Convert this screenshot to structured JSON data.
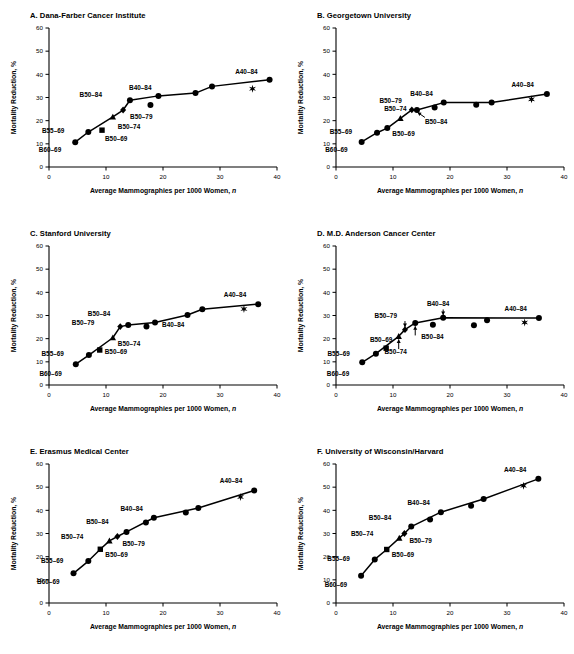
{
  "figure": {
    "axis_x_label": "Average Mammographies per 1000 Women,",
    "axis_x_label_italic": "n",
    "axis_y_label": "Mortality Reduction, %",
    "x_ticks": [
      "0",
      "10",
      "20",
      "30",
      "40"
    ],
    "y_ticks": [
      "0",
      "10",
      "20",
      "30",
      "40",
      "50",
      "60"
    ],
    "xlim": [
      0,
      40
    ],
    "ylim": [
      0,
      60
    ],
    "ink": "#000000",
    "background": "#ffffff"
  },
  "chart_data": [
    {
      "type": "scatter",
      "panel": "A",
      "title": "A. Dana-Farber Cancer Institute",
      "xlabel": "Average Mammographies per 1000 Women, n",
      "ylabel": "Mortality Reduction, %",
      "xlim": [
        0,
        40
      ],
      "ylim": [
        0,
        60
      ],
      "grid": false,
      "legend": "none",
      "points": [
        {
          "label": "B60-69",
          "x": 4.6,
          "y": 10.7,
          "marker": "circle",
          "label_dx": -14,
          "label_dy": 10
        },
        {
          "label": "B55-69",
          "x": 6.9,
          "y": 15.1,
          "marker": "circle",
          "label_dx": -24,
          "label_dy": 1
        },
        {
          "label": "B50-69",
          "x": 9.3,
          "y": 15.9,
          "marker": "square",
          "label_dx": 3,
          "label_dy": 11
        },
        {
          "label": "B50-74",
          "x": 11.2,
          "y": 21.6,
          "marker": "triangle",
          "label_dx": 5,
          "label_dy": 12
        },
        {
          "label": "B50-79",
          "x": 13.0,
          "y": 24.6,
          "marker": "diamond",
          "label_dx": 7,
          "label_dy": 9
        },
        {
          "label": "B50-84",
          "x": 14.2,
          "y": 28.8,
          "marker": "circle",
          "label_dx": -28,
          "label_dy": -3
        },
        {
          "label": "",
          "x": 17.8,
          "y": 26.8,
          "marker": "circle",
          "label_dx": 0,
          "label_dy": 0
        },
        {
          "label": "B40-84",
          "x": 19.2,
          "y": 30.7,
          "marker": "circle",
          "label_dx": -7,
          "label_dy": -6
        },
        {
          "label": "",
          "x": 25.7,
          "y": 31.9,
          "marker": "circle",
          "label_dx": 0,
          "label_dy": 0
        },
        {
          "label": "",
          "x": 28.6,
          "y": 34.8,
          "marker": "circle",
          "label_dx": 0,
          "label_dy": 0
        },
        {
          "label": "",
          "x": 35.7,
          "y": 33.8,
          "marker": "star",
          "label_dx": 0,
          "label_dy": 0
        },
        {
          "label": "A40-84",
          "x": 38.7,
          "y": 37.7,
          "marker": "circle",
          "label_dx": -12,
          "label_dy": -6
        }
      ],
      "curve": [
        [
          4.6,
          10.7
        ],
        [
          6.9,
          15.1
        ],
        [
          11.2,
          21.6
        ],
        [
          13.0,
          24.6
        ],
        [
          14.2,
          28.8
        ],
        [
          19.2,
          30.7
        ],
        [
          25.7,
          31.9
        ],
        [
          28.6,
          34.8
        ],
        [
          38.7,
          37.7
        ]
      ],
      "arrows": []
    },
    {
      "type": "scatter",
      "panel": "B",
      "title": "B. Georgetown University",
      "xlabel": "Average Mammographies per 1000 Women, n",
      "ylabel": "Mortality Reduction, %",
      "xlim": [
        0,
        40
      ],
      "ylim": [
        0,
        60
      ],
      "grid": false,
      "legend": "none",
      "points": [
        {
          "label": "B60-69",
          "x": 4.5,
          "y": 10.8,
          "marker": "circle",
          "label_dx": -14,
          "label_dy": 10
        },
        {
          "label": "B55-69",
          "x": 7.2,
          "y": 14.8,
          "marker": "circle",
          "label_dx": -25,
          "label_dy": 1
        },
        {
          "label": "B50-69",
          "x": 9.0,
          "y": 16.8,
          "marker": "circle",
          "label_dx": 5,
          "label_dy": 8
        },
        {
          "label": "B50-74",
          "x": 11.3,
          "y": 21.0,
          "marker": "triangle",
          "label_dx": -5,
          "label_dy": -7
        },
        {
          "label": "B50-79",
          "x": 13.3,
          "y": 24.7,
          "marker": "diamond",
          "label_dx": -10,
          "label_dy": -7
        },
        {
          "label": "B50-84",
          "x": 14.2,
          "y": 24.6,
          "marker": "circle",
          "label_dx": 8,
          "label_dy": 14
        },
        {
          "label": "",
          "x": 17.3,
          "y": 25.7,
          "marker": "circle",
          "label_dx": 0,
          "label_dy": 0
        },
        {
          "label": "B40-84",
          "x": 18.9,
          "y": 27.8,
          "marker": "circle",
          "label_dx": -11,
          "label_dy": -7
        },
        {
          "label": "",
          "x": 24.6,
          "y": 26.9,
          "marker": "circle",
          "label_dx": 0,
          "label_dy": 0
        },
        {
          "label": "",
          "x": 27.3,
          "y": 27.8,
          "marker": "circle",
          "label_dx": 0,
          "label_dy": 0
        },
        {
          "label": "",
          "x": 34.3,
          "y": 29.2,
          "marker": "star",
          "label_dx": 0,
          "label_dy": 0
        },
        {
          "label": "A40-84",
          "x": 37.0,
          "y": 31.5,
          "marker": "circle",
          "label_dx": -13,
          "label_dy": -7
        }
      ],
      "curve": [
        [
          4.5,
          10.8
        ],
        [
          7.2,
          14.8
        ],
        [
          9.0,
          16.8
        ],
        [
          11.3,
          21.0
        ],
        [
          13.3,
          24.7
        ],
        [
          14.2,
          24.6
        ],
        [
          18.9,
          27.8
        ],
        [
          27.3,
          27.8
        ],
        [
          37.0,
          31.5
        ]
      ],
      "arrows": [
        {
          "from_label": "B50-84",
          "x1": 15.6,
          "y1": 21.4,
          "x2": 14.3,
          "y2": 23.6
        }
      ]
    },
    {
      "type": "scatter",
      "panel": "C",
      "title": "C. Stanford University",
      "xlabel": "Average Mammographies per 1000 Women, n",
      "ylabel": "Mortality Reduction, %",
      "xlim": [
        0,
        40
      ],
      "ylim": [
        0,
        60
      ],
      "grid": false,
      "legend": "none",
      "points": [
        {
          "label": "B60-69",
          "x": 4.7,
          "y": 9.0,
          "marker": "circle",
          "label_dx": -14,
          "label_dy": 12
        },
        {
          "label": "B55-69",
          "x": 7.0,
          "y": 12.9,
          "marker": "circle",
          "label_dx": -25,
          "label_dy": 1
        },
        {
          "label": "B50-69",
          "x": 8.9,
          "y": 15.1,
          "marker": "square",
          "label_dx": 5,
          "label_dy": 4
        },
        {
          "label": "B50-74",
          "x": 11.2,
          "y": 20.4,
          "marker": "triangle",
          "label_dx": 5,
          "label_dy": 8
        },
        {
          "label": "B50-79",
          "x": 12.5,
          "y": 25.2,
          "marker": "diamond",
          "label_dx": -26,
          "label_dy": -2
        },
        {
          "label": "B50-84",
          "x": 13.9,
          "y": 25.9,
          "marker": "circle",
          "label_dx": -18,
          "label_dy": -9
        },
        {
          "label": "",
          "x": 17.1,
          "y": 25.2,
          "marker": "circle",
          "label_dx": 0,
          "label_dy": 0
        },
        {
          "label": "B40-84",
          "x": 18.6,
          "y": 27.0,
          "marker": "circle",
          "label_dx": 7,
          "label_dy": 5
        },
        {
          "label": "",
          "x": 24.3,
          "y": 30.2,
          "marker": "circle",
          "label_dx": 0,
          "label_dy": 0
        },
        {
          "label": "",
          "x": 26.9,
          "y": 32.7,
          "marker": "circle",
          "label_dx": 0,
          "label_dy": 0
        },
        {
          "label": "",
          "x": 34.2,
          "y": 32.8,
          "marker": "star",
          "label_dx": 0,
          "label_dy": 0
        },
        {
          "label": "A40-84",
          "x": 36.7,
          "y": 34.9,
          "marker": "circle",
          "label_dx": -12,
          "label_dy": -7
        }
      ],
      "curve": [
        [
          4.7,
          9.0
        ],
        [
          7.0,
          12.9
        ],
        [
          11.2,
          20.4
        ],
        [
          12.5,
          25.2
        ],
        [
          13.9,
          25.9
        ],
        [
          18.6,
          27.0
        ],
        [
          24.3,
          30.2
        ],
        [
          26.9,
          32.7
        ],
        [
          36.7,
          34.9
        ]
      ],
      "arrows": []
    },
    {
      "type": "scatter",
      "panel": "D",
      "title": "D. M.D. Anderson Cancer Center",
      "xlabel": "Average Mammographies per 1000 Women, n",
      "ylabel": "Mortality Reduction, %",
      "xlim": [
        0,
        40
      ],
      "ylim": [
        0,
        60
      ],
      "grid": false,
      "legend": "none",
      "points": [
        {
          "label": "B60-69",
          "x": 4.6,
          "y": 9.8,
          "marker": "circle",
          "label_dx": -13,
          "label_dy": 14
        },
        {
          "label": "B55-69",
          "x": 7.0,
          "y": 13.5,
          "marker": "circle",
          "label_dx": -26,
          "label_dy": 2
        },
        {
          "label": "B50-69",
          "x": 8.8,
          "y": 15.9,
          "marker": "square",
          "label_dx": -5,
          "label_dy": -6
        },
        {
          "label": "B50-74",
          "x": 11.0,
          "y": 21.0,
          "marker": "triangle",
          "label_dx": -3,
          "label_dy": 18
        },
        {
          "label": "B50-79",
          "x": 12.1,
          "y": 23.9,
          "marker": "diamond",
          "label_dx": -8,
          "label_dy": -12
        },
        {
          "label": "B50-84",
          "x": 13.9,
          "y": 26.8,
          "marker": "circle",
          "label_dx": 6,
          "label_dy": 16
        },
        {
          "label": "",
          "x": 17.0,
          "y": 26.0,
          "marker": "circle",
          "label_dx": 0,
          "label_dy": 0
        },
        {
          "label": "B40-84",
          "x": 18.8,
          "y": 29.0,
          "marker": "circle",
          "label_dx": -5,
          "label_dy": -12
        },
        {
          "label": "",
          "x": 24.2,
          "y": 25.8,
          "marker": "circle",
          "label_dx": 0,
          "label_dy": 0
        },
        {
          "label": "",
          "x": 26.5,
          "y": 27.9,
          "marker": "circle",
          "label_dx": 0,
          "label_dy": 0
        },
        {
          "label": "",
          "x": 33.1,
          "y": 27.0,
          "marker": "star",
          "label_dx": 0,
          "label_dy": 0
        },
        {
          "label": "A40-84",
          "x": 35.6,
          "y": 28.9,
          "marker": "circle",
          "label_dx": -12,
          "label_dy": -7
        }
      ],
      "curve": [
        [
          4.6,
          9.8
        ],
        [
          7.0,
          13.5
        ],
        [
          11.0,
          21.0
        ],
        [
          12.1,
          23.9
        ],
        [
          13.9,
          26.8
        ],
        [
          18.8,
          29.0
        ],
        [
          35.6,
          28.9
        ]
      ],
      "arrows": [
        {
          "from_label": "B50-79",
          "x1": 12.1,
          "y1": 27.6,
          "x2": 12.1,
          "y2": 25.0
        },
        {
          "from_label": "B40-84",
          "x1": 18.8,
          "y1": 32.6,
          "x2": 18.8,
          "y2": 30.2
        },
        {
          "from_label": "B50-84",
          "x1": 13.9,
          "y1": 21.4,
          "x2": 13.9,
          "y2": 25.4
        },
        {
          "from_label": "B50-74",
          "x1": 11.0,
          "y1": 15.5,
          "x2": 11.0,
          "y2": 19.7
        }
      ]
    },
    {
      "type": "scatter",
      "panel": "E",
      "title": "E. Erasmus Medical Center",
      "xlabel": "Average Mammographies per 1000 Women, n",
      "ylabel": "Mortality Reduction, %",
      "xlim": [
        0,
        40
      ],
      "ylim": [
        0,
        60
      ],
      "grid": false,
      "legend": "none",
      "points": [
        {
          "label": "B60-69",
          "x": 4.3,
          "y": 12.8,
          "marker": "circle",
          "label_dx": -14,
          "label_dy": 11
        },
        {
          "label": "B55-69",
          "x": 6.9,
          "y": 18.1,
          "marker": "circle",
          "label_dx": -25,
          "label_dy": 2
        },
        {
          "label": "B50-69",
          "x": 9.0,
          "y": 23.2,
          "marker": "square",
          "label_dx": 5,
          "label_dy": 8
        },
        {
          "label": "B50-74",
          "x": 10.6,
          "y": 26.8,
          "marker": "triangle",
          "label_dx": -26,
          "label_dy": -2
        },
        {
          "label": "B50-79",
          "x": 12.0,
          "y": 28.7,
          "marker": "diamond",
          "label_dx": 5,
          "label_dy": 9
        },
        {
          "label": "B50-84",
          "x": 13.6,
          "y": 30.7,
          "marker": "circle",
          "label_dx": -18,
          "label_dy": -8
        },
        {
          "label": "",
          "x": 17.0,
          "y": 34.8,
          "marker": "circle",
          "label_dx": 0,
          "label_dy": 0
        },
        {
          "label": "B40-84",
          "x": 18.4,
          "y": 36.8,
          "marker": "circle",
          "label_dx": -11,
          "label_dy": -7
        },
        {
          "label": "",
          "x": 24.0,
          "y": 39.1,
          "marker": "circle",
          "label_dx": 0,
          "label_dy": 0
        },
        {
          "label": "",
          "x": 26.2,
          "y": 41.0,
          "marker": "circle",
          "label_dx": 0,
          "label_dy": 0
        },
        {
          "label": "",
          "x": 33.6,
          "y": 45.8,
          "marker": "star",
          "label_dx": 0,
          "label_dy": 0
        },
        {
          "label": "A40-84",
          "x": 36.0,
          "y": 48.6,
          "marker": "circle",
          "label_dx": -12,
          "label_dy": -7
        }
      ],
      "curve": [
        [
          4.3,
          12.8
        ],
        [
          6.9,
          18.1
        ],
        [
          9.0,
          23.2
        ],
        [
          10.6,
          26.8
        ],
        [
          12.0,
          28.7
        ],
        [
          13.6,
          30.7
        ],
        [
          18.4,
          36.8
        ],
        [
          26.2,
          41.0
        ],
        [
          36.0,
          48.6
        ]
      ],
      "arrows": []
    },
    {
      "type": "scatter",
      "panel": "F",
      "title": "F. University of Wisconsin/Harvard",
      "xlabel": "Average Mammographies per 1000 Women, n",
      "ylabel": "Mortality Reduction, %",
      "xlim": [
        0,
        40
      ],
      "ylim": [
        0,
        60
      ],
      "grid": false,
      "legend": "none",
      "points": [
        {
          "label": "B60-69",
          "x": 4.4,
          "y": 11.8,
          "marker": "circle",
          "label_dx": -14,
          "label_dy": 11
        },
        {
          "label": "B55-69",
          "x": 6.8,
          "y": 18.8,
          "marker": "circle",
          "label_dx": -25,
          "label_dy": 2
        },
        {
          "label": "B50-69",
          "x": 8.9,
          "y": 23.1,
          "marker": "square",
          "label_dx": 5,
          "label_dy": 8
        },
        {
          "label": "B50-74",
          "x": 11.1,
          "y": 28.0,
          "marker": "triangle",
          "label_dx": -26,
          "label_dy": -2
        },
        {
          "label": "B50-79",
          "x": 12.0,
          "y": 30.0,
          "marker": "diamond",
          "label_dx": 5,
          "label_dy": 9
        },
        {
          "label": "B50-84",
          "x": 13.2,
          "y": 33.0,
          "marker": "circle",
          "label_dx": -20,
          "label_dy": -7
        },
        {
          "label": "",
          "x": 16.5,
          "y": 36.0,
          "marker": "circle",
          "label_dx": 0,
          "label_dy": 0
        },
        {
          "label": "B40-84",
          "x": 18.4,
          "y": 39.2,
          "marker": "circle",
          "label_dx": -11,
          "label_dy": -7
        },
        {
          "label": "",
          "x": 23.7,
          "y": 42.0,
          "marker": "circle",
          "label_dx": 0,
          "label_dy": 0
        },
        {
          "label": "",
          "x": 25.9,
          "y": 44.9,
          "marker": "circle",
          "label_dx": 0,
          "label_dy": 0
        },
        {
          "label": "",
          "x": 32.9,
          "y": 50.6,
          "marker": "star",
          "label_dx": 0,
          "label_dy": 0
        },
        {
          "label": "A40-84",
          "x": 35.5,
          "y": 53.6,
          "marker": "circle",
          "label_dx": -12,
          "label_dy": -7
        }
      ],
      "curve": [
        [
          4.4,
          11.8
        ],
        [
          6.8,
          18.8
        ],
        [
          8.9,
          23.1
        ],
        [
          11.1,
          28.0
        ],
        [
          12.0,
          30.0
        ],
        [
          13.2,
          33.0
        ],
        [
          18.4,
          39.2
        ],
        [
          25.9,
          44.9
        ],
        [
          35.5,
          53.6
        ]
      ],
      "arrows": []
    }
  ]
}
